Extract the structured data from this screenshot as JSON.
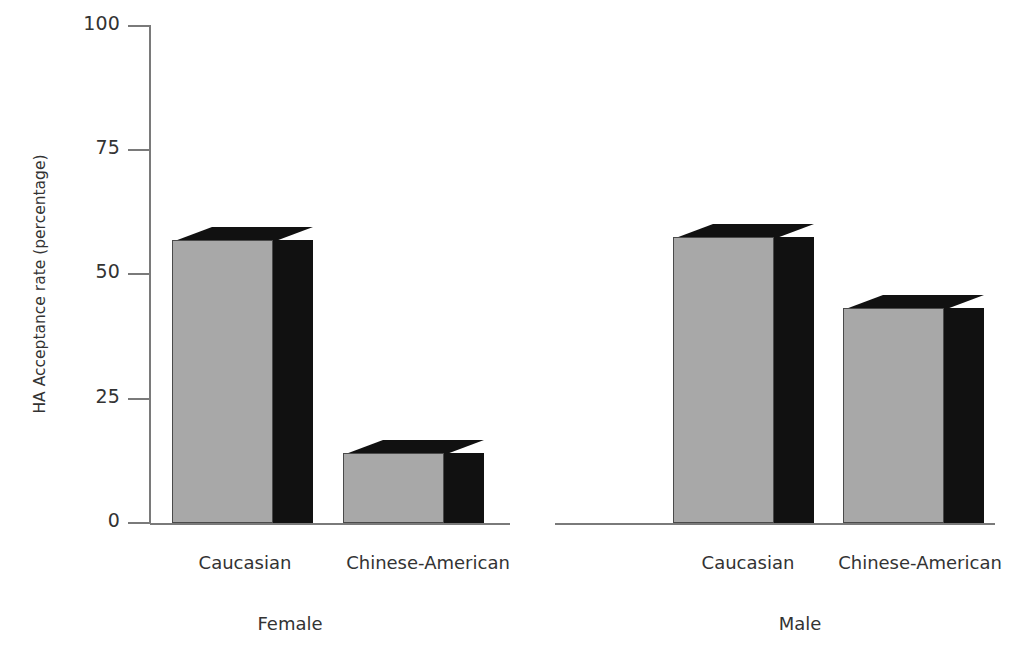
{
  "chart_data": {
    "type": "bar",
    "title": "",
    "xlabel": "",
    "ylabel": "HA Acceptance rate (percentage)",
    "ylim": [
      0,
      100
    ],
    "yticks": [
      0,
      25,
      50,
      75,
      100
    ],
    "ytick_labels": [
      "0",
      "25",
      "50",
      "75",
      "100"
    ],
    "grid": false,
    "legend": "none",
    "style": "3d-bar",
    "groups": [
      "Female",
      "Male"
    ],
    "categories": [
      "Caucasian",
      "Chinese-American"
    ],
    "bars": [
      {
        "group": "Female",
        "category": "Caucasian",
        "value": 57
      },
      {
        "group": "Female",
        "category": "Chinese-American",
        "value": 14
      },
      {
        "group": "Male",
        "category": "Caucasian",
        "value": 57.5
      },
      {
        "group": "Male",
        "category": "Chinese-American",
        "value": 43.3
      }
    ],
    "series": [
      {
        "name": "Female",
        "values": [
          57,
          14
        ]
      },
      {
        "name": "Male",
        "values": [
          57.5,
          43.3
        ]
      }
    ],
    "colors": {
      "bar_face": "#a8a8a8",
      "bar_shade": "#111111",
      "bar_outline": "#4a4a4a",
      "axis": "#7a7a7a",
      "text": "#333333",
      "background": "#ffffff"
    }
  },
  "axis": {
    "y_title": "HA Acceptance rate (percentage)",
    "ticks": [
      {
        "label": "100",
        "value": 100
      },
      {
        "label": "75",
        "value": 75
      },
      {
        "label": "50",
        "value": 50
      },
      {
        "label": "25",
        "value": 25
      },
      {
        "label": "0",
        "value": 0
      }
    ]
  },
  "category_labels": [
    {
      "text": "Caucasian"
    },
    {
      "text": "Chinese-American"
    },
    {
      "text": "Caucasian"
    },
    {
      "text": "Chinese-American"
    }
  ],
  "group_labels": [
    {
      "text": "Female"
    },
    {
      "text": "Male"
    }
  ]
}
